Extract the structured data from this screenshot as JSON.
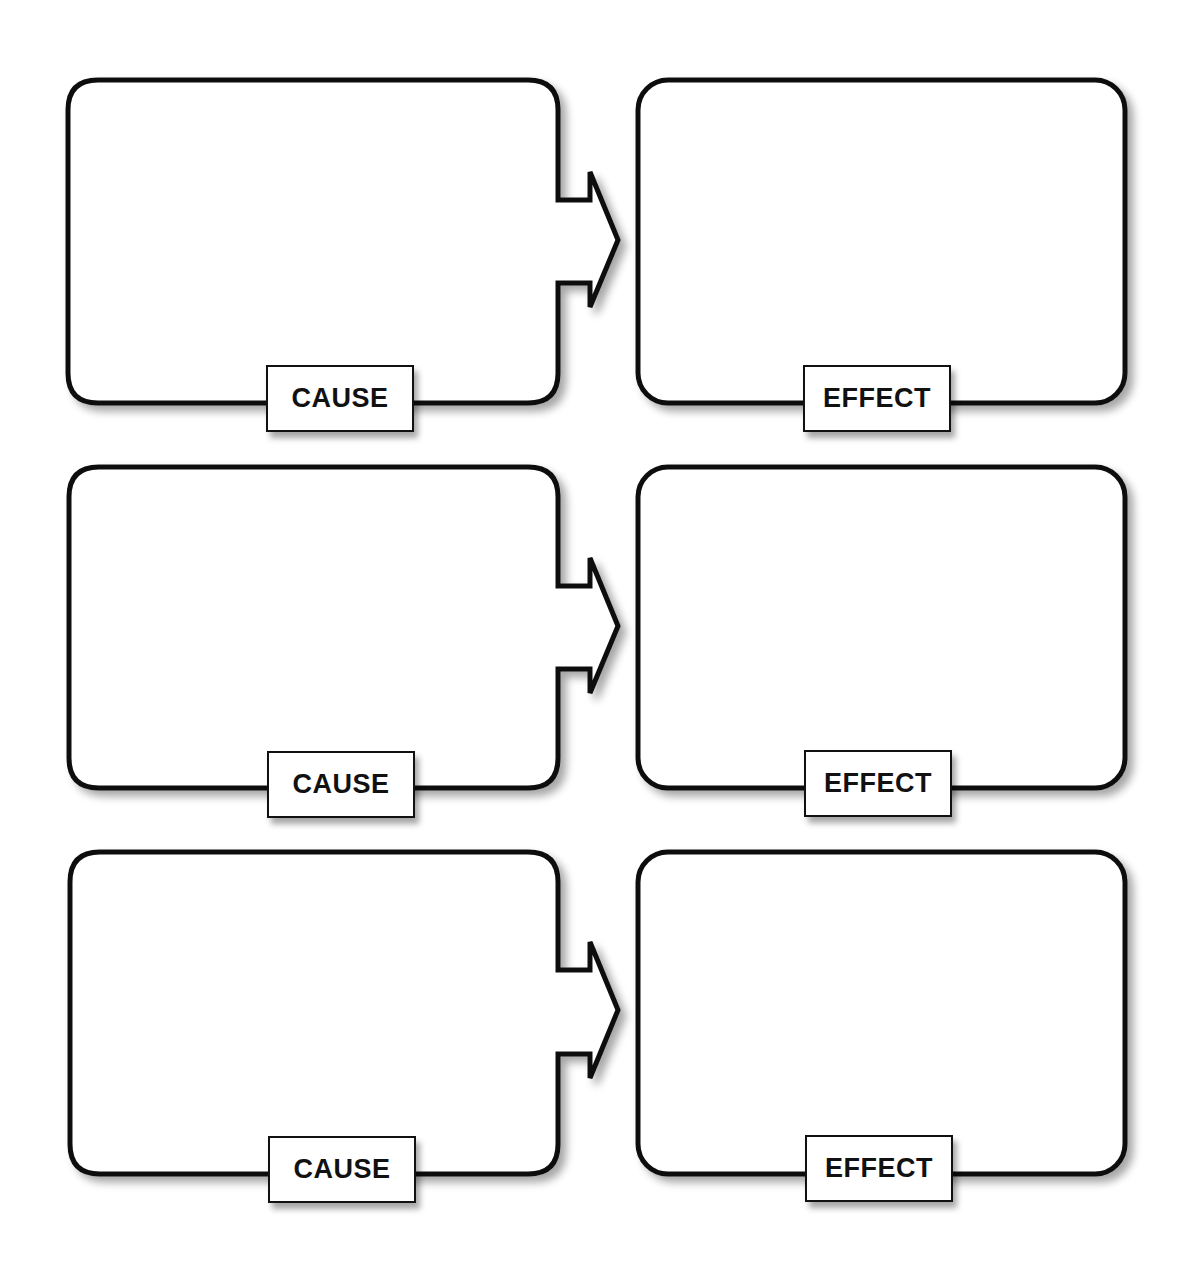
{
  "diagram": {
    "title": "",
    "colors": {
      "stroke": "#111111",
      "fill": "#ffffff",
      "shadow": "#9a9a9a"
    },
    "rows": [
      {
        "cause": {
          "label": "CAUSE",
          "content": ""
        },
        "effect": {
          "label": "EFFECT",
          "content": ""
        }
      },
      {
        "cause": {
          "label": "CAUSE",
          "content": ""
        },
        "effect": {
          "label": "EFFECT",
          "content": ""
        }
      },
      {
        "cause": {
          "label": "CAUSE",
          "content": ""
        },
        "effect": {
          "label": "EFFECT",
          "content": ""
        }
      }
    ]
  }
}
